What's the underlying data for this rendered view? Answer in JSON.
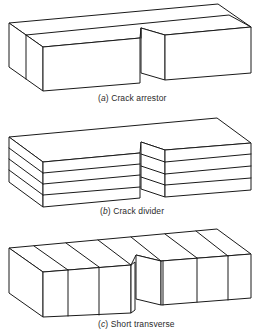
{
  "figures": [
    {
      "id": "a",
      "label": "(a)",
      "letter": "a",
      "title": "Crack arrestor",
      "caption": "(a) Crack arrestor",
      "description": "Notched block split by one vertical longitudinal plane (layer parallel to side face)"
    },
    {
      "id": "b",
      "label": "(b)",
      "letter": "b",
      "title": "Crack divider",
      "caption": "(b) Crack divider",
      "description": "Notched block built of horizontal laminated layers (4 lamination lines)"
    },
    {
      "id": "c",
      "label": "(c)",
      "letter": "c",
      "title": "Short transverse",
      "caption": "(c) Short transverse",
      "description": "Notched block divided by transverse vertical slices"
    }
  ],
  "colors": {
    "line": "#1a1a1a",
    "background": "#ffffff",
    "text": "#2a2a2a"
  }
}
